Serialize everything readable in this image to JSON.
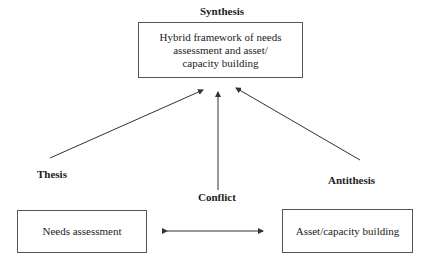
{
  "diagram": {
    "synthesis": {
      "label": "Synthesis",
      "box_line1": "Hybrid framework of needs",
      "box_line2": "assessment and asset/",
      "box_line3": "capacity building"
    },
    "thesis": {
      "label": "Thesis",
      "box": "Needs assessment"
    },
    "antithesis": {
      "label": "Antithesis",
      "box": "Asset/capacity building"
    },
    "conflict": {
      "label": "Conflict"
    },
    "edges": [
      {
        "from": "Thesis",
        "to": "Synthesis",
        "type": "arrow"
      },
      {
        "from": "Conflict",
        "to": "Synthesis",
        "type": "arrow"
      },
      {
        "from": "Antithesis",
        "to": "Synthesis",
        "type": "arrow"
      },
      {
        "from": "Needs assessment",
        "to": "Asset/capacity building",
        "type": "bidirectional-arrow"
      }
    ],
    "line_color": "#333333"
  }
}
